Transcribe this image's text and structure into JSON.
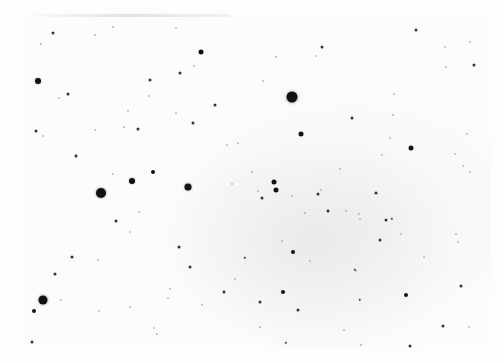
{
  "image": {
    "description": "Inverted (negative) astronomical photograph of a star field; dark dots are stars on a white background with a faint diffuse grey glow near the center-right",
    "width": 504,
    "height": 363,
    "background_color": "#fdfdfd",
    "star_color": "#111111",
    "faint_star_color": "#9a9a9a"
  },
  "stars": [
    {
      "x": 292,
      "y": 97,
      "r": 5.5
    },
    {
      "x": 101,
      "y": 193,
      "r": 5
    },
    {
      "x": 43,
      "y": 300,
      "r": 4.5
    },
    {
      "x": 188,
      "y": 187,
      "r": 3.5
    },
    {
      "x": 132,
      "y": 181,
      "r": 3
    },
    {
      "x": 38,
      "y": 81,
      "r": 3
    },
    {
      "x": 201,
      "y": 52,
      "r": 2.5
    },
    {
      "x": 274,
      "y": 182,
      "r": 2.5
    },
    {
      "x": 276,
      "y": 190,
      "r": 2.5
    },
    {
      "x": 301,
      "y": 134,
      "r": 2.5
    },
    {
      "x": 411,
      "y": 148,
      "r": 2.5
    },
    {
      "x": 153,
      "y": 172,
      "r": 2
    },
    {
      "x": 34,
      "y": 311,
      "r": 2
    },
    {
      "x": 293,
      "y": 252,
      "r": 2
    },
    {
      "x": 283,
      "y": 292,
      "r": 2
    },
    {
      "x": 406,
      "y": 295,
      "r": 2
    },
    {
      "x": 53,
      "y": 33,
      "r": 1.5
    },
    {
      "x": 150,
      "y": 80,
      "r": 1.5
    },
    {
      "x": 180,
      "y": 73,
      "r": 1.5
    },
    {
      "x": 68,
      "y": 94,
      "r": 1.5
    },
    {
      "x": 36,
      "y": 131,
      "r": 1.5
    },
    {
      "x": 76,
      "y": 156,
      "r": 1.5
    },
    {
      "x": 138,
      "y": 129,
      "r": 1.5
    },
    {
      "x": 193,
      "y": 123,
      "r": 1.5
    },
    {
      "x": 215,
      "y": 105,
      "r": 1.5
    },
    {
      "x": 322,
      "y": 47,
      "r": 1.5
    },
    {
      "x": 416,
      "y": 30,
      "r": 1.5
    },
    {
      "x": 474,
      "y": 65,
      "r": 1.5
    },
    {
      "x": 352,
      "y": 118,
      "r": 1.5
    },
    {
      "x": 262,
      "y": 198,
      "r": 1.5
    },
    {
      "x": 318,
      "y": 194,
      "r": 1.5
    },
    {
      "x": 376,
      "y": 193,
      "r": 1.5
    },
    {
      "x": 386,
      "y": 220,
      "r": 1.5
    },
    {
      "x": 380,
      "y": 240,
      "r": 1.5
    },
    {
      "x": 328,
      "y": 211,
      "r": 1.5
    },
    {
      "x": 116,
      "y": 221,
      "r": 1.5
    },
    {
      "x": 72,
      "y": 257,
      "r": 1.5
    },
    {
      "x": 55,
      "y": 274,
      "r": 1.5
    },
    {
      "x": 179,
      "y": 247,
      "r": 1.5
    },
    {
      "x": 190,
      "y": 267,
      "r": 1.5
    },
    {
      "x": 224,
      "y": 292,
      "r": 1.5
    },
    {
      "x": 260,
      "y": 302,
      "r": 1.5
    },
    {
      "x": 298,
      "y": 310,
      "r": 1.5
    },
    {
      "x": 443,
      "y": 326,
      "r": 1.5
    },
    {
      "x": 461,
      "y": 286,
      "r": 1.5
    },
    {
      "x": 32,
      "y": 342,
      "r": 1.5
    },
    {
      "x": 410,
      "y": 346,
      "r": 1.5
    },
    {
      "x": 392,
      "y": 219,
      "r": 1.2
    },
    {
      "x": 286,
      "y": 343,
      "r": 1.2
    },
    {
      "x": 245,
      "y": 258,
      "r": 1.2
    },
    {
      "x": 360,
      "y": 300,
      "r": 1.2
    },
    {
      "x": 355,
      "y": 270,
      "r": 1.2
    }
  ],
  "faint_stars": [
    {
      "x": 95,
      "y": 35
    },
    {
      "x": 113,
      "y": 27
    },
    {
      "x": 176,
      "y": 28
    },
    {
      "x": 41,
      "y": 44
    },
    {
      "x": 194,
      "y": 66
    },
    {
      "x": 149,
      "y": 96
    },
    {
      "x": 128,
      "y": 111
    },
    {
      "x": 59,
      "y": 98
    },
    {
      "x": 95,
      "y": 130
    },
    {
      "x": 43,
      "y": 136
    },
    {
      "x": 76,
      "y": 155
    },
    {
      "x": 113,
      "y": 174
    },
    {
      "x": 124,
      "y": 127
    },
    {
      "x": 176,
      "y": 113
    },
    {
      "x": 227,
      "y": 145
    },
    {
      "x": 238,
      "y": 143
    },
    {
      "x": 263,
      "y": 81
    },
    {
      "x": 276,
      "y": 57
    },
    {
      "x": 316,
      "y": 56
    },
    {
      "x": 394,
      "y": 94
    },
    {
      "x": 445,
      "y": 47
    },
    {
      "x": 470,
      "y": 42
    },
    {
      "x": 446,
      "y": 67
    },
    {
      "x": 393,
      "y": 115
    },
    {
      "x": 467,
      "y": 134
    },
    {
      "x": 455,
      "y": 154
    },
    {
      "x": 463,
      "y": 166
    },
    {
      "x": 470,
      "y": 172
    },
    {
      "x": 390,
      "y": 138
    },
    {
      "x": 340,
      "y": 169
    },
    {
      "x": 382,
      "y": 155
    },
    {
      "x": 252,
      "y": 172
    },
    {
      "x": 292,
      "y": 196
    },
    {
      "x": 321,
      "y": 190
    },
    {
      "x": 346,
      "y": 211
    },
    {
      "x": 359,
      "y": 214
    },
    {
      "x": 456,
      "y": 234
    },
    {
      "x": 458,
      "y": 242
    },
    {
      "x": 401,
      "y": 234
    },
    {
      "x": 360,
      "y": 219
    },
    {
      "x": 310,
      "y": 261
    },
    {
      "x": 356,
      "y": 271
    },
    {
      "x": 282,
      "y": 241
    },
    {
      "x": 139,
      "y": 212
    },
    {
      "x": 130,
      "y": 232
    },
    {
      "x": 98,
      "y": 260
    },
    {
      "x": 61,
      "y": 300
    },
    {
      "x": 99,
      "y": 311
    },
    {
      "x": 130,
      "y": 307
    },
    {
      "x": 157,
      "y": 334
    },
    {
      "x": 154,
      "y": 328
    },
    {
      "x": 170,
      "y": 289
    },
    {
      "x": 168,
      "y": 298
    },
    {
      "x": 202,
      "y": 305
    },
    {
      "x": 235,
      "y": 279
    },
    {
      "x": 260,
      "y": 327
    },
    {
      "x": 344,
      "y": 330
    },
    {
      "x": 361,
      "y": 345
    },
    {
      "x": 469,
      "y": 327
    },
    {
      "x": 424,
      "y": 257
    },
    {
      "x": 258,
      "y": 191
    },
    {
      "x": 305,
      "y": 213
    },
    {
      "x": 232,
      "y": 184
    }
  ]
}
